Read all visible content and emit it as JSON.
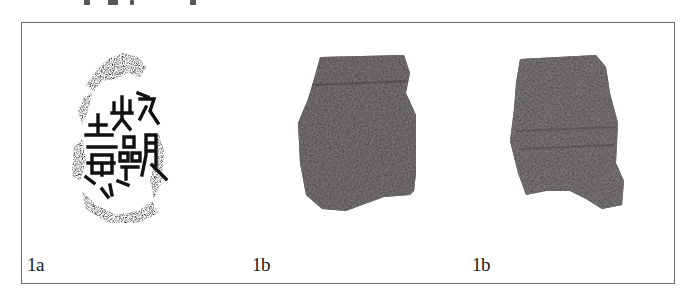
{
  "figure": {
    "panels": [
      {
        "id": "1a",
        "label": "1a",
        "description": "ink rubbing of inscription with archaic characters"
      },
      {
        "id": "1b-front",
        "label": "1b",
        "description": "photograph of dark object fragment, front view"
      },
      {
        "id": "1b-back",
        "label": "1b",
        "description": "photograph of dark object fragment, reverse view"
      }
    ],
    "colors": {
      "frame": "#6a6a6a",
      "object": "#2b2828",
      "ink": "#111111"
    }
  }
}
